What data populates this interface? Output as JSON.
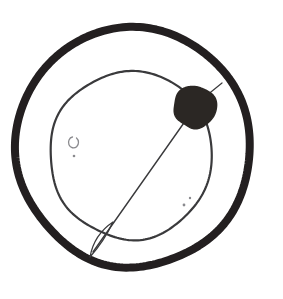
{
  "image": {
    "kind": "hand-drawn-sketch",
    "title": "Atom with orbit and nucleus sketch",
    "width": 283,
    "height": 299,
    "background_color": "#ffffff",
    "text_labels": []
  },
  "palette": {
    "background": "#ffffff",
    "heavy_ink": "#231f20",
    "thin_ink": "#3a3a3c",
    "faint_ink": "#8a8a8e",
    "blob_fill": "#2b2724"
  },
  "shapes": {
    "outer_ring": {
      "name": "outer-ring",
      "type": "circle",
      "cx": 133,
      "cy": 147,
      "r": 117,
      "stroke_width": 8,
      "color": "#231f20"
    },
    "inner_orbit": {
      "name": "inner-orbit",
      "type": "circle",
      "cx": 131,
      "cy": 155,
      "r": 83,
      "stroke_width": 2.2,
      "color": "#3a3a3c"
    },
    "nucleus_blob": {
      "name": "nucleus-blob",
      "type": "circle",
      "cx": 195,
      "cy": 107,
      "r": 21,
      "color": "#2b2724"
    },
    "diagonal_axis": {
      "name": "diagonal-axis-line",
      "type": "line",
      "x1": 193,
      "y1": 110,
      "x2": 93,
      "y2": 252,
      "stroke_width": 1.4,
      "color": "#3a3a3c"
    },
    "antenna_stub": {
      "name": "antenna-stub",
      "type": "line",
      "x1": 206,
      "y1": 96,
      "x2": 222,
      "y2": 83,
      "stroke_width": 1.2,
      "color": "#3a3a3c"
    },
    "needle_tip": {
      "name": "needle-tip-leaf",
      "type": "leaf",
      "apex_x": 90,
      "apex_y": 257,
      "stroke_width": 1.3,
      "color": "#3a3a3c"
    },
    "speck_c": {
      "name": "speck-c-mark",
      "type": "arc-mark",
      "cx": 72,
      "cy": 142,
      "r": 5,
      "color": "#8a8a8e"
    },
    "speck_dot_left": {
      "name": "speck-dot-left",
      "type": "dot",
      "cx": 74,
      "cy": 156,
      "r": 1.3,
      "color": "#8a8a8e"
    },
    "speck_dot_right_a": {
      "name": "speck-dot-right-upper",
      "type": "dot",
      "cx": 190,
      "cy": 198,
      "r": 1.2,
      "color": "#8a8a8e"
    },
    "speck_dot_right_b": {
      "name": "speck-dot-right-lower",
      "type": "dot",
      "cx": 184,
      "cy": 205,
      "r": 1.4,
      "color": "#8a8a8e"
    }
  }
}
